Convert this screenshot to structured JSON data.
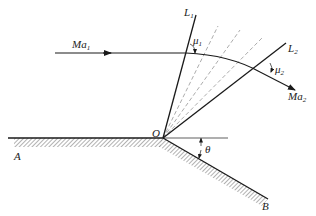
{
  "diagram": {
    "colors": {
      "line": "#1a1a1a",
      "dashed": "#888888",
      "hatch": "#555555",
      "background": "#ffffff"
    },
    "labels": {
      "ma1": {
        "main": "Ma",
        "sub": "1"
      },
      "ma2": {
        "main": "Ma",
        "sub": "2"
      },
      "l1": {
        "main": "L",
        "sub": "1"
      },
      "l2": {
        "main": "L",
        "sub": "2"
      },
      "mu1": {
        "main": "μ",
        "sub": "1"
      },
      "mu2": {
        "main": "μ",
        "sub": "2"
      },
      "corner": "O",
      "theta": "θ",
      "point_a": "A",
      "point_b": "B"
    },
    "geometry": {
      "corner_O": [
        163,
        138
      ],
      "wall_left_start": [
        8,
        138
      ],
      "wall_end_B": [
        268,
        199
      ],
      "l1_end": [
        196,
        15
      ],
      "l2_end": [
        286,
        43
      ],
      "incoming_flow_start": [
        55,
        53
      ],
      "outgoing_flow_end": [
        295,
        90
      ],
      "dashed_rays_ends": [
        [
          218,
          26
        ],
        [
          240,
          30
        ],
        [
          262,
          38
        ]
      ],
      "reference_line_end": [
        228,
        138
      ]
    }
  }
}
